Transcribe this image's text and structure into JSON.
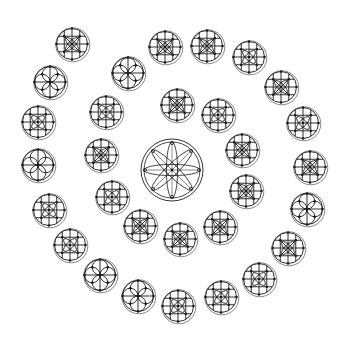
{
  "figure": {
    "background": "#ffffff",
    "stroke_color": "#1a1a1a",
    "outline_color": "#555555"
  },
  "center_rosette": {
    "cx": 172,
    "cy": 170,
    "r": 31,
    "petals": 8,
    "type": "eight-petal-wheel"
  },
  "rosettes": [
    {
      "cx": 72,
      "cy": 44,
      "type": "quad-square"
    },
    {
      "cx": 50,
      "cy": 82,
      "type": "four-petal"
    },
    {
      "cx": 38,
      "cy": 122,
      "type": "quad-grid"
    },
    {
      "cx": 38,
      "cy": 165,
      "type": "four-lobe"
    },
    {
      "cx": 49,
      "cy": 210,
      "type": "quad-grid"
    },
    {
      "cx": 70,
      "cy": 245,
      "type": "quad-grid"
    },
    {
      "cx": 100,
      "cy": 275,
      "type": "four-petal"
    },
    {
      "cx": 138,
      "cy": 296,
      "type": "four-petal"
    },
    {
      "cx": 178,
      "cy": 306,
      "type": "quad-grid"
    },
    {
      "cx": 221,
      "cy": 297,
      "type": "quad-grid"
    },
    {
      "cx": 259,
      "cy": 279,
      "type": "quad-grid"
    },
    {
      "cx": 288,
      "cy": 248,
      "type": "quad-square"
    },
    {
      "cx": 307,
      "cy": 209,
      "type": "four-petal"
    },
    {
      "cx": 310,
      "cy": 167,
      "type": "quad-square"
    },
    {
      "cx": 303,
      "cy": 123,
      "type": "quad-grid"
    },
    {
      "cx": 281,
      "cy": 87,
      "type": "quad-square"
    },
    {
      "cx": 249,
      "cy": 57,
      "type": "quad-grid"
    },
    {
      "cx": 207,
      "cy": 46,
      "type": "quad-square"
    },
    {
      "cx": 165,
      "cy": 47,
      "type": "quad-square"
    },
    {
      "cx": 128,
      "cy": 73,
      "type": "four-petal"
    },
    {
      "cx": 106,
      "cy": 112,
      "type": "quad-grid"
    },
    {
      "cx": 101,
      "cy": 155,
      "type": "quad-square"
    },
    {
      "cx": 112,
      "cy": 197,
      "type": "quad-grid"
    },
    {
      "cx": 140,
      "cy": 226,
      "type": "quad-square"
    },
    {
      "cx": 180,
      "cy": 239,
      "type": "quad-square"
    },
    {
      "cx": 220,
      "cy": 227,
      "type": "quad-square"
    },
    {
      "cx": 246,
      "cy": 191,
      "type": "quad-square"
    },
    {
      "cx": 242,
      "cy": 150,
      "type": "quad-square"
    },
    {
      "cx": 218,
      "cy": 115,
      "type": "quad-grid"
    },
    {
      "cx": 177,
      "cy": 105,
      "type": "quad-square"
    }
  ],
  "rosette_radius": 17
}
